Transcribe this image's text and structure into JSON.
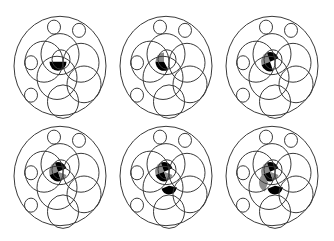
{
  "diagram": {
    "type": "venn-sequence",
    "panel_count": 6,
    "layout": {
      "columns": 3,
      "rows": 2
    },
    "colors": {
      "stroke": "#3a3a3a",
      "black": "#000000",
      "gray": "#8c8c8c",
      "background": "#ffffff"
    },
    "circles": [
      {
        "name": "outer-boundary",
        "cx": 0,
        "cy": 0,
        "r": 46
      },
      {
        "name": "small-top-left",
        "cx": -6,
        "cy": -36,
        "r": 6.5
      },
      {
        "name": "small-top-right",
        "cx": 19,
        "cy": -33,
        "r": 6.5
      },
      {
        "name": "small-left",
        "cx": -29,
        "cy": -3,
        "r": 6.5
      },
      {
        "name": "small-bottom-left",
        "cx": -29,
        "cy": 27,
        "r": 6.5
      },
      {
        "name": "large-left",
        "cx": -16,
        "cy": -4,
        "r": 19
      },
      {
        "name": "large-top",
        "cx": 0,
        "cy": -11,
        "r": 19
      },
      {
        "name": "large-right",
        "cx": 21,
        "cy": -3,
        "r": 18
      },
      {
        "name": "large-middle",
        "cx": -3,
        "cy": 11,
        "r": 20
      },
      {
        "name": "large-lower-right",
        "cx": 24,
        "cy": 17,
        "r": 17
      },
      {
        "name": "large-bottom",
        "cx": 3,
        "cy": 33,
        "r": 15.5
      },
      {
        "name": "inner-small",
        "cx": 1,
        "cy": -6,
        "r": 9
      }
    ],
    "panels": [
      {
        "id": 1,
        "cx": 60,
        "cy": 66,
        "fills": [
          {
            "shape": "sector",
            "cx": -2,
            "cy": -4,
            "r": 8.5,
            "a0": 180,
            "a1": 360,
            "color": "black"
          }
        ]
      },
      {
        "id": 2,
        "cx": 166,
        "cy": 66,
        "fills": [
          {
            "shape": "sector",
            "cx": -2,
            "cy": -4,
            "r": 8.5,
            "a0": 90,
            "a1": 180,
            "color": "gray"
          },
          {
            "shape": "sector",
            "cx": -2,
            "cy": -4,
            "r": 8.5,
            "a0": 180,
            "a1": 300,
            "color": "black"
          }
        ]
      },
      {
        "id": 3,
        "cx": 272,
        "cy": 66,
        "fills": [
          {
            "shape": "sector",
            "cx": -2,
            "cy": -4,
            "r": 9,
            "a0": 110,
            "a1": 200,
            "color": "gray"
          },
          {
            "shape": "sector",
            "cx": -2,
            "cy": -4,
            "r": 9,
            "a0": 20,
            "a1": 110,
            "color": "black"
          },
          {
            "shape": "sector",
            "cx": -2,
            "cy": -4,
            "r": 9,
            "a0": 200,
            "a1": 290,
            "color": "black"
          }
        ]
      },
      {
        "id": 4,
        "cx": 60,
        "cy": 176,
        "fills": [
          {
            "shape": "sector",
            "cx": -2,
            "cy": -4,
            "r": 9,
            "a0": 110,
            "a1": 200,
            "color": "gray"
          },
          {
            "shape": "sector",
            "cx": -2,
            "cy": -4,
            "r": 9,
            "a0": 20,
            "a1": 110,
            "color": "black"
          },
          {
            "shape": "sector",
            "cx": -2,
            "cy": -4,
            "r": 9,
            "a0": 200,
            "a1": 290,
            "color": "black"
          },
          {
            "shape": "sector",
            "cx": -2,
            "cy": -4,
            "r": 9,
            "a0": 290,
            "a1": 340,
            "color": "gray"
          }
        ]
      },
      {
        "id": 5,
        "cx": 166,
        "cy": 176,
        "fills": [
          {
            "shape": "sector",
            "cx": -2,
            "cy": -4,
            "r": 9,
            "a0": 110,
            "a1": 200,
            "color": "gray"
          },
          {
            "shape": "sector",
            "cx": -2,
            "cy": -4,
            "r": 9,
            "a0": 20,
            "a1": 110,
            "color": "black"
          },
          {
            "shape": "sector",
            "cx": -2,
            "cy": -4,
            "r": 9,
            "a0": 200,
            "a1": 290,
            "color": "black"
          },
          {
            "shape": "sector",
            "cx": -2,
            "cy": -4,
            "r": 9,
            "a0": 290,
            "a1": 340,
            "color": "gray"
          },
          {
            "shape": "sector",
            "cx": 3,
            "cy": 9,
            "r": 8,
            "a0": 200,
            "a1": 350,
            "color": "black"
          }
        ]
      },
      {
        "id": 6,
        "cx": 272,
        "cy": 176,
        "fills": [
          {
            "shape": "sector",
            "cx": -2,
            "cy": -4,
            "r": 9,
            "a0": 110,
            "a1": 200,
            "color": "gray"
          },
          {
            "shape": "sector",
            "cx": -2,
            "cy": -4,
            "r": 9,
            "a0": 20,
            "a1": 110,
            "color": "black"
          },
          {
            "shape": "sector",
            "cx": -2,
            "cy": -4,
            "r": 9,
            "a0": 200,
            "a1": 290,
            "color": "black"
          },
          {
            "shape": "sector",
            "cx": -2,
            "cy": -4,
            "r": 9,
            "a0": 290,
            "a1": 340,
            "color": "gray"
          },
          {
            "shape": "sector",
            "cx": 3,
            "cy": 9,
            "r": 8,
            "a0": 200,
            "a1": 350,
            "color": "black"
          },
          {
            "shape": "sector",
            "cx": -4,
            "cy": 6,
            "r": 9,
            "a0": 120,
            "a1": 250,
            "color": "gray"
          }
        ]
      }
    ]
  }
}
